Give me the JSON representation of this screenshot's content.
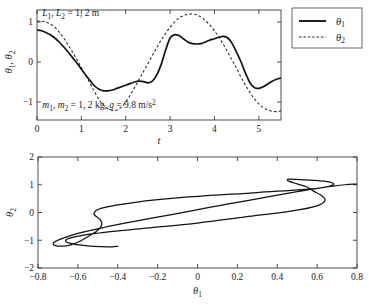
{
  "chart_data": [
    {
      "type": "line",
      "name": "time-series",
      "title": "",
      "xlabel": "t",
      "ylabel": "θ₁, θ₂",
      "xlim": [
        0,
        5.5
      ],
      "ylim": [
        -1.45,
        1.3
      ],
      "xticks": [
        0,
        1,
        2,
        3,
        4,
        5
      ],
      "xtick_labels": [
        "0",
        "1",
        "2",
        "3",
        "4",
        "5"
      ],
      "yticks": [
        -1,
        0,
        1
      ],
      "ytick_labels": [
        "−1",
        "0",
        "1"
      ],
      "grid": false,
      "legend_position": "outside-right-top",
      "annotations": [
        {
          "text": "L₁, L₂ = 1, 2 m",
          "x": 0.15,
          "y": 1.18
        },
        {
          "text": "m₁, m₂ = 1, 2 kg, g = 9.8 m/s²",
          "x": 0.15,
          "y": -1.14
        }
      ],
      "series": [
        {
          "name": "θ₁",
          "style": "solid",
          "x": [
            0.0,
            0.1,
            0.2,
            0.3,
            0.4,
            0.5,
            0.6,
            0.7,
            0.8,
            0.9,
            1.0,
            1.1,
            1.2,
            1.3,
            1.4,
            1.5,
            1.6,
            1.7,
            1.8,
            1.9,
            2.0,
            2.1,
            2.2,
            2.3,
            2.4,
            2.5,
            2.6,
            2.7,
            2.8,
            2.9,
            3.0,
            3.1,
            3.2,
            3.3,
            3.4,
            3.5,
            3.6,
            3.7,
            3.8,
            3.9,
            4.0,
            4.1,
            4.2,
            4.3,
            4.4,
            4.5,
            4.6,
            4.7,
            4.8,
            4.9,
            5.0,
            5.1,
            5.2,
            5.3,
            5.4,
            5.5
          ],
          "y": [
            0.8,
            0.78,
            0.74,
            0.68,
            0.6,
            0.5,
            0.38,
            0.25,
            0.11,
            -0.03,
            -0.18,
            -0.33,
            -0.47,
            -0.6,
            -0.68,
            -0.72,
            -0.72,
            -0.7,
            -0.66,
            -0.62,
            -0.58,
            -0.54,
            -0.5,
            -0.48,
            -0.49,
            -0.52,
            -0.48,
            -0.32,
            -0.06,
            0.3,
            0.6,
            0.68,
            0.66,
            0.58,
            0.5,
            0.46,
            0.45,
            0.46,
            0.5,
            0.55,
            0.58,
            0.62,
            0.64,
            0.6,
            0.46,
            0.24,
            0.0,
            -0.28,
            -0.52,
            -0.64,
            -0.66,
            -0.62,
            -0.55,
            -0.48,
            -0.43,
            -0.4
          ]
        },
        {
          "name": "θ₂",
          "style": "dashed",
          "x": [
            0.0,
            0.1,
            0.2,
            0.3,
            0.4,
            0.5,
            0.6,
            0.7,
            0.8,
            0.9,
            1.0,
            1.1,
            1.2,
            1.3,
            1.4,
            1.5,
            1.6,
            1.7,
            1.8,
            1.9,
            2.0,
            2.1,
            2.2,
            2.3,
            2.4,
            2.5,
            2.6,
            2.7,
            2.8,
            2.9,
            3.0,
            3.1,
            3.2,
            3.3,
            3.4,
            3.5,
            3.6,
            3.7,
            3.8,
            3.9,
            4.0,
            4.1,
            4.2,
            4.3,
            4.4,
            4.5,
            4.6,
            4.7,
            4.8,
            4.9,
            5.0,
            5.1,
            5.2,
            5.3,
            5.4,
            5.5
          ],
          "y": [
            1.02,
            1.02,
            1.0,
            0.95,
            0.87,
            0.75,
            0.6,
            0.43,
            0.25,
            0.06,
            -0.14,
            -0.34,
            -0.54,
            -0.75,
            -0.94,
            -1.08,
            -1.17,
            -1.21,
            -1.2,
            -1.13,
            -1.0,
            -0.83,
            -0.64,
            -0.44,
            -0.24,
            -0.04,
            0.16,
            0.36,
            0.55,
            0.72,
            0.87,
            1.0,
            1.1,
            1.16,
            1.19,
            1.2,
            1.18,
            1.12,
            1.03,
            0.92,
            0.78,
            0.62,
            0.44,
            0.24,
            0.04,
            -0.16,
            -0.38,
            -0.58,
            -0.76,
            -0.92,
            -1.05,
            -1.14,
            -1.2,
            -1.23,
            -1.24,
            -1.22
          ]
        }
      ],
      "legend": [
        {
          "label": "θ₁",
          "style": "solid"
        },
        {
          "label": "θ₂",
          "style": "dashed"
        }
      ]
    },
    {
      "type": "line",
      "name": "phase-portrait",
      "title": "",
      "xlabel": "θ₁",
      "ylabel": "θ₂",
      "xlim": [
        -0.8,
        0.8
      ],
      "ylim": [
        -2,
        2
      ],
      "xticks": [
        -0.8,
        -0.6,
        -0.4,
        -0.2,
        0,
        0.2,
        0.4,
        0.6,
        0.8
      ],
      "xtick_labels": [
        "−0.8",
        "−0.6",
        "−0.4",
        "−0.2",
        "0",
        "0.2",
        "0.4",
        "0.6",
        "0.8"
      ],
      "yticks": [
        -2,
        -1,
        0,
        1,
        2
      ],
      "ytick_labels": [
        "−2",
        "−1",
        "0",
        "1",
        "2"
      ],
      "grid": false,
      "series": [
        {
          "name": "θ₂ vs θ₁",
          "style": "solid",
          "x": [
            0.8,
            0.78,
            0.74,
            0.68,
            0.6,
            0.5,
            0.38,
            0.25,
            0.11,
            -0.03,
            -0.18,
            -0.33,
            -0.47,
            -0.6,
            -0.68,
            -0.72,
            -0.72,
            -0.7,
            -0.66,
            -0.62,
            -0.58,
            -0.54,
            -0.5,
            -0.48,
            -0.49,
            -0.52,
            -0.48,
            -0.32,
            -0.06,
            0.3,
            0.6,
            0.68,
            0.66,
            0.58,
            0.5,
            0.46,
            0.45,
            0.46,
            0.5,
            0.55,
            0.58,
            0.62,
            0.64,
            0.6,
            0.46,
            0.24,
            0.0,
            -0.28,
            -0.52,
            -0.64,
            -0.66,
            -0.62,
            -0.55,
            -0.48,
            -0.43,
            -0.4
          ],
          "y": [
            1.02,
            1.02,
            1.0,
            0.95,
            0.87,
            0.75,
            0.6,
            0.43,
            0.25,
            0.06,
            -0.14,
            -0.34,
            -0.54,
            -0.75,
            -0.94,
            -1.08,
            -1.17,
            -1.21,
            -1.2,
            -1.13,
            -1.0,
            -0.83,
            -0.64,
            -0.44,
            -0.24,
            -0.04,
            0.16,
            0.36,
            0.55,
            0.72,
            0.87,
            1.0,
            1.1,
            1.16,
            1.19,
            1.2,
            1.18,
            1.12,
            1.03,
            0.92,
            0.78,
            0.62,
            0.44,
            0.24,
            0.04,
            -0.16,
            -0.38,
            -0.58,
            -0.76,
            -0.92,
            -1.05,
            -1.14,
            -1.2,
            -1.23,
            -1.24,
            -1.22
          ]
        }
      ]
    }
  ]
}
